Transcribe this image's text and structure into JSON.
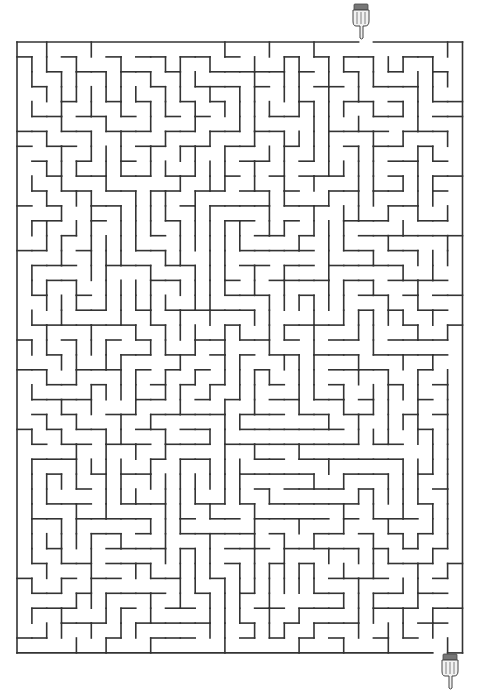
{
  "puzzle": {
    "type": "maze",
    "cols": 30,
    "rows": 41,
    "origin": [
      17,
      42
    ],
    "cell": 14.85,
    "cell_h": 14.9,
    "wall_color": "#333333",
    "background": "#ffffff",
    "seed": 20240517
  },
  "start": {
    "icon": "pointing-hand-down-icon",
    "col": 23,
    "position": [
      352,
      4
    ]
  },
  "finish": {
    "icon": "pointing-hand-down-icon",
    "col": 28,
    "position": [
      441,
      654
    ]
  }
}
